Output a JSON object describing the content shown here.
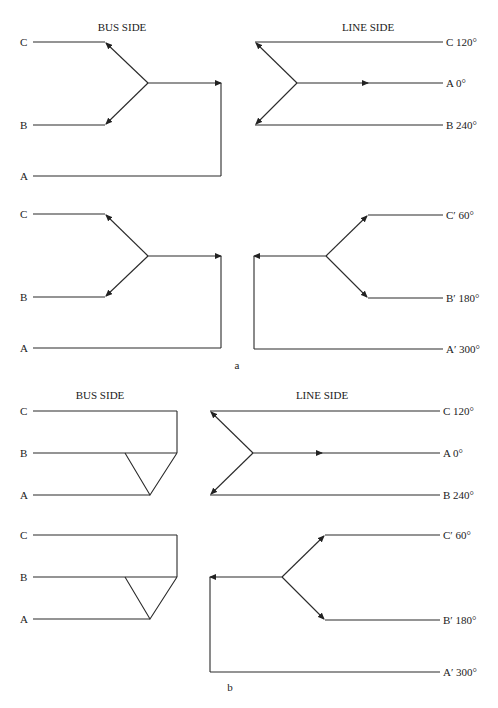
{
  "figure": {
    "panels": [
      {
        "id": "a",
        "caption": "a",
        "bus_side_title": "BUS SIDE",
        "line_side_title": "LINE SIDE",
        "upper": {
          "bus_labels": [
            "C",
            "B",
            "A"
          ],
          "line_labels": [
            "C 120°",
            "A 0°",
            "B 240°"
          ]
        },
        "lower": {
          "bus_labels": [
            "C",
            "B",
            "A"
          ],
          "line_labels": [
            "C′ 60°",
            "B′ 180°",
            "A′ 300°"
          ]
        }
      },
      {
        "id": "b",
        "caption": "b",
        "bus_side_title": "BUS SIDE",
        "line_side_title": "LINE SIDE",
        "upper": {
          "bus_labels": [
            "C",
            "B",
            "A"
          ],
          "line_labels": [
            "C 120°",
            "A 0°",
            "B 240°"
          ]
        },
        "lower": {
          "bus_labels": [
            "C",
            "B",
            "A"
          ],
          "line_labels": [
            "C′ 60°",
            "B′ 180°",
            "A′ 300°"
          ]
        }
      }
    ]
  }
}
